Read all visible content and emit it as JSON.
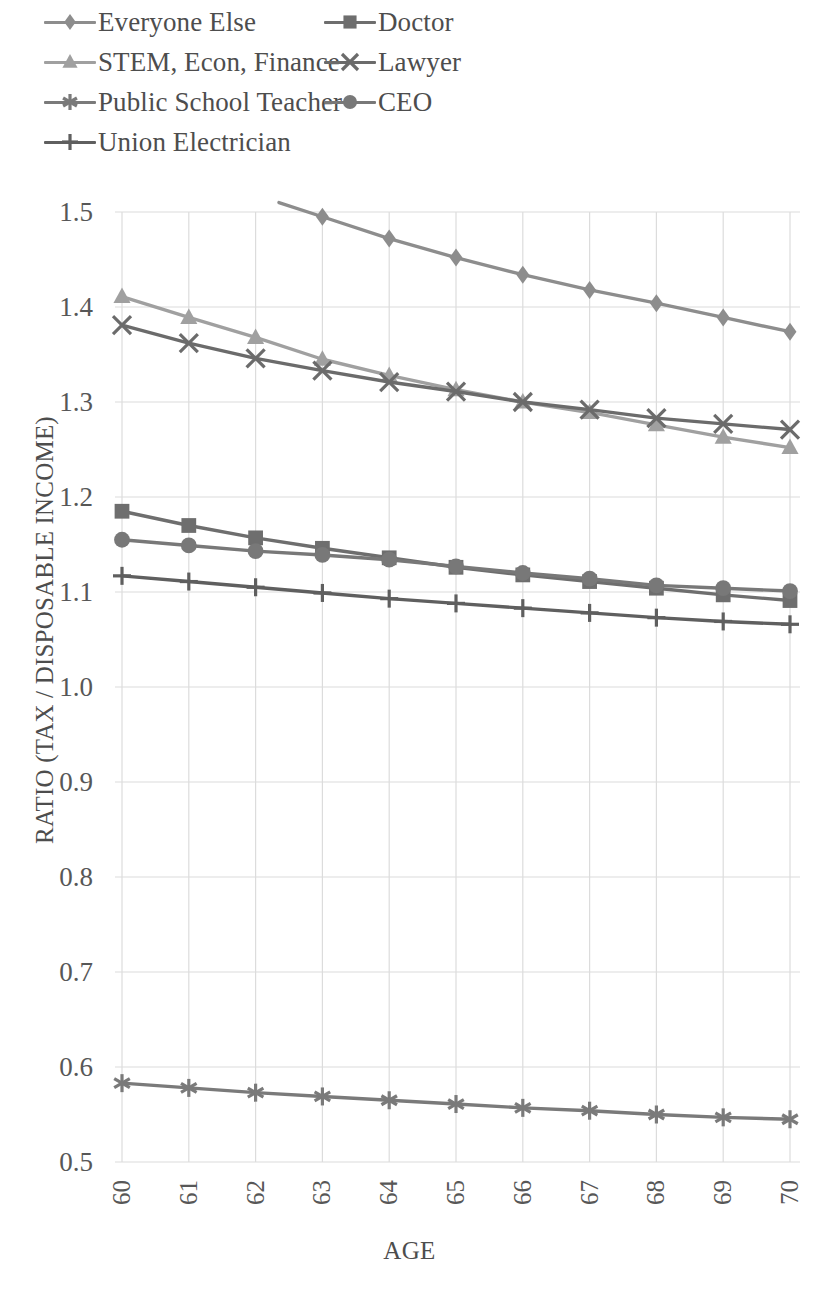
{
  "chart_data": {
    "type": "line",
    "title": "",
    "xlabel": "AGE",
    "ylabel": "RATIO (TAX / DISPOSABLE INCOME)",
    "x": [
      60,
      61,
      62,
      63,
      64,
      65,
      66,
      67,
      68,
      69,
      70
    ],
    "xlim": [
      60,
      70
    ],
    "ylim": [
      0.5,
      1.5
    ],
    "y_ticks": [
      "0.5",
      "0.6",
      "0.7",
      "0.8",
      "0.9",
      "1.0",
      "1.1",
      "1.2",
      "1.3",
      "1.4",
      "1.5"
    ],
    "x_ticks": [
      "60",
      "61",
      "62",
      "63",
      "64",
      "65",
      "66",
      "67",
      "68",
      "69",
      "70"
    ],
    "grid": true,
    "legend_position": "top",
    "series": [
      {
        "name": "Everyone Else",
        "marker": "diamond",
        "color": "#8d8d8d",
        "values": [
          null,
          null,
          null,
          1.495,
          1.472,
          1.452,
          1.434,
          1.418,
          1.404,
          1.389,
          1.374
        ]
      },
      {
        "name": "Doctor",
        "marker": "square",
        "color": "#6e6e6e",
        "values": [
          1.185,
          1.17,
          1.157,
          1.146,
          1.136,
          1.126,
          1.118,
          1.111,
          1.104,
          1.097,
          1.091
        ]
      },
      {
        "name": "STEM, Econ, Finance",
        "marker": "triangle",
        "color": "#a0a0a0",
        "values": [
          1.411,
          1.389,
          1.368,
          1.345,
          1.328,
          1.313,
          1.3,
          1.289,
          1.276,
          1.263,
          1.252
        ]
      },
      {
        "name": "Lawyer",
        "marker": "x",
        "color": "#6b6b6b",
        "values": [
          1.381,
          1.362,
          1.346,
          1.333,
          1.321,
          1.311,
          1.3,
          1.292,
          1.283,
          1.277,
          1.271
        ]
      },
      {
        "name": "Public School Teacher",
        "marker": "asterisk",
        "color": "#7a7a7a",
        "values": [
          0.583,
          0.578,
          0.573,
          0.569,
          0.565,
          0.561,
          0.557,
          0.554,
          0.55,
          0.547,
          0.545
        ]
      },
      {
        "name": "CEO",
        "marker": "circle",
        "color": "#787878",
        "values": [
          1.155,
          1.149,
          1.143,
          1.139,
          1.134,
          1.127,
          1.12,
          1.114,
          1.107,
          1.104,
          1.101
        ]
      },
      {
        "name": "Union Electrician",
        "marker": "plus",
        "color": "#5f5f5f",
        "values": [
          1.117,
          1.111,
          1.105,
          1.099,
          1.093,
          1.088,
          1.083,
          1.078,
          1.073,
          1.069,
          1.066
        ]
      }
    ]
  },
  "legend": {
    "rows": [
      [
        {
          "name": "Everyone Else",
          "marker": "diamond",
          "color": "#8d8d8d"
        },
        {
          "name": "Doctor",
          "marker": "square",
          "color": "#6e6e6e"
        }
      ],
      [
        {
          "name": "STEM, Econ, Finance",
          "marker": "triangle",
          "color": "#a0a0a0"
        },
        {
          "name": "Lawyer",
          "marker": "x",
          "color": "#6b6b6b"
        }
      ],
      [
        {
          "name": "Public School Teacher",
          "marker": "asterisk",
          "color": "#7a7a7a"
        },
        {
          "name": "CEO",
          "marker": "circle",
          "color": "#787878"
        }
      ],
      [
        {
          "name": "Union Electrician",
          "marker": "plus",
          "color": "#5f5f5f"
        }
      ]
    ]
  },
  "style": {
    "grid_color": "#dcdcdc",
    "text_color": "#4d4d4d",
    "background": "#ffffff"
  }
}
